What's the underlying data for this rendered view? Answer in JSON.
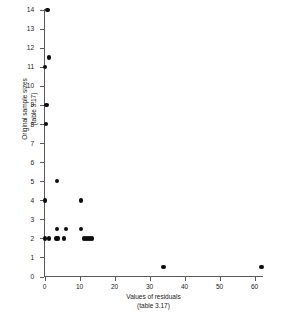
{
  "chart_data": {
    "type": "scatter",
    "title": "",
    "xlabel": "Values of residuals",
    "xlabel_line2": "(table 3.17)",
    "ylabel": "Original sample sizes",
    "ylabel_line2": "(table 3.17)",
    "xlim": [
      0,
      65
    ],
    "ylim": [
      0,
      14.3
    ],
    "grid": false,
    "legend": "none",
    "marker_color": "#0d0d0d",
    "axis_color": "#5a5a5a",
    "xticks": [
      0,
      10,
      20,
      30,
      40,
      50,
      60
    ],
    "xtick_labels": [
      "0",
      "10",
      "20",
      "30",
      "40",
      "50",
      "60"
    ],
    "yticks": [
      0,
      1,
      2,
      3,
      4,
      5,
      6,
      7,
      8,
      9,
      10,
      11,
      12,
      13,
      14
    ],
    "ytick_labels": [
      "0",
      "1",
      "2",
      "3",
      "4",
      "5",
      "6",
      "7",
      "8",
      "9",
      "10",
      "11",
      "12",
      "13",
      "14"
    ],
    "points": [
      {
        "x": 0.8,
        "y": 14.0
      },
      {
        "x": 1.2,
        "y": 11.5
      },
      {
        "x": 0.2,
        "y": 11.0
      },
      {
        "x": 0.6,
        "y": 9.0
      },
      {
        "x": 0.4,
        "y": 8.0
      },
      {
        "x": 3.6,
        "y": 5.0
      },
      {
        "x": 0.2,
        "y": 4.0
      },
      {
        "x": 10.4,
        "y": 4.0
      },
      {
        "x": 3.5,
        "y": 2.5
      },
      {
        "x": 6.2,
        "y": 2.5
      },
      {
        "x": 10.5,
        "y": 2.5
      },
      {
        "x": 0.1,
        "y": 2.0
      },
      {
        "x": 1.3,
        "y": 2.0
      },
      {
        "x": 3.4,
        "y": 2.0
      },
      {
        "x": 3.9,
        "y": 2.0
      },
      {
        "x": 5.6,
        "y": 2.0
      },
      {
        "x": 11.2,
        "y": 2.0
      },
      {
        "x": 11.8,
        "y": 2.0
      },
      {
        "x": 12.4,
        "y": 2.0
      },
      {
        "x": 13.0,
        "y": 2.0
      },
      {
        "x": 13.6,
        "y": 2.0
      },
      {
        "x": 34.0,
        "y": 0.5
      },
      {
        "x": 62.0,
        "y": 0.5
      }
    ]
  },
  "axes": {
    "x_axis_name": "values-of-residuals-axis",
    "y_axis_name": "original-sample-sizes-axis"
  }
}
